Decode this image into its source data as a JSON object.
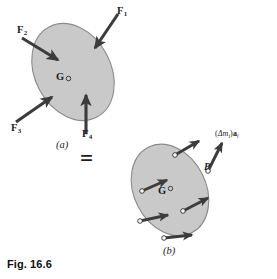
{
  "figure": {
    "caption": "Fig. 16.6",
    "equals_sign": "=",
    "part_a": {
      "label": "(a)",
      "center_of_mass": {
        "symbol": "G",
        "marker": "open-circle"
      },
      "body_fill_color": "#c9c9c9",
      "body_stroke_color": "#8a8a8a",
      "forces": [
        {
          "id": "F1",
          "base": "F",
          "subscript": "1",
          "direction": "down-left"
        },
        {
          "id": "F2",
          "base": "F",
          "subscript": "2",
          "direction": "down-right"
        },
        {
          "id": "F3",
          "base": "F",
          "subscript": "3",
          "direction": "up-right"
        },
        {
          "id": "F4",
          "base": "F",
          "subscript": "4",
          "direction": "up"
        }
      ]
    },
    "part_b": {
      "label": "(b)",
      "center_of_mass": {
        "symbol": "G",
        "marker": "open-circle"
      },
      "point_label": "P",
      "accel_label": {
        "open_paren": "(",
        "delta": "Δ",
        "mass_symbol": "m",
        "mass_subscript": "i",
        "close_paren": ")",
        "accel_symbol": "a",
        "accel_subscript": "i",
        "full": "(Δmᵢ)aᵢ"
      },
      "body_fill_color": "#c9c9c9",
      "body_stroke_color": "#8a8a8a",
      "particle_count": 6
    }
  },
  "colors": {
    "arrow": "#3c3c3c",
    "background": "#ffffff",
    "text": "#1c1c1c",
    "body_fill": "#c9c9c9",
    "body_stroke": "#8a8a8a"
  }
}
